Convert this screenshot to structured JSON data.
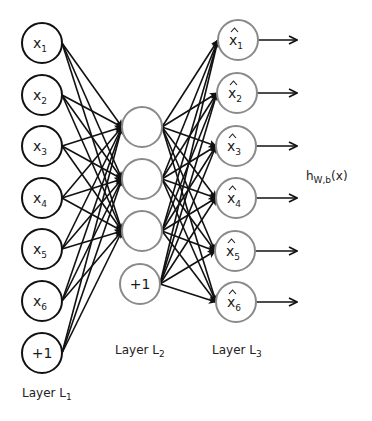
{
  "diagram": {
    "type": "autoencoder-neural-network",
    "colors": {
      "input_stroke": "#111111",
      "hidden_stroke": "#8a8a8a",
      "output_stroke": "#8a8a8a",
      "edge": "#111111",
      "text": "#222222"
    },
    "layers": [
      {
        "id": "L1",
        "label": "Layer L",
        "label_sub": "1",
        "nodes": [
          {
            "text": "x",
            "sub": "1",
            "hat": false
          },
          {
            "text": "x",
            "sub": "2",
            "hat": false
          },
          {
            "text": "x",
            "sub": "3",
            "hat": false
          },
          {
            "text": "x",
            "sub": "4",
            "hat": false
          },
          {
            "text": "x",
            "sub": "5",
            "hat": false
          },
          {
            "text": "x",
            "sub": "6",
            "hat": false
          },
          {
            "text": "+1",
            "sub": "",
            "hat": false,
            "bias": true
          }
        ]
      },
      {
        "id": "L2",
        "label": "Layer L",
        "label_sub": "2",
        "nodes": [
          {
            "text": "",
            "sub": "",
            "hat": false
          },
          {
            "text": "",
            "sub": "",
            "hat": false
          },
          {
            "text": "",
            "sub": "",
            "hat": false
          },
          {
            "text": "+1",
            "sub": "",
            "hat": false,
            "bias": true
          }
        ]
      },
      {
        "id": "L3",
        "label": "Layer L",
        "label_sub": "3",
        "nodes": [
          {
            "text": "x",
            "sub": "1",
            "hat": true
          },
          {
            "text": "x",
            "sub": "2",
            "hat": true
          },
          {
            "text": "x",
            "sub": "3",
            "hat": true
          },
          {
            "text": "x",
            "sub": "4",
            "hat": true
          },
          {
            "text": "x",
            "sub": "5",
            "hat": true
          },
          {
            "text": "x",
            "sub": "6",
            "hat": true
          }
        ]
      }
    ],
    "output_label": {
      "text": "h",
      "sub": "W,b",
      "suffix": "(x)"
    },
    "edges": "fully connected L1 (all 7 nodes) -> L2 (3 non-bias nodes); L2 (all 4 nodes) -> L3 (6 nodes); arrows out of each L3 node"
  }
}
